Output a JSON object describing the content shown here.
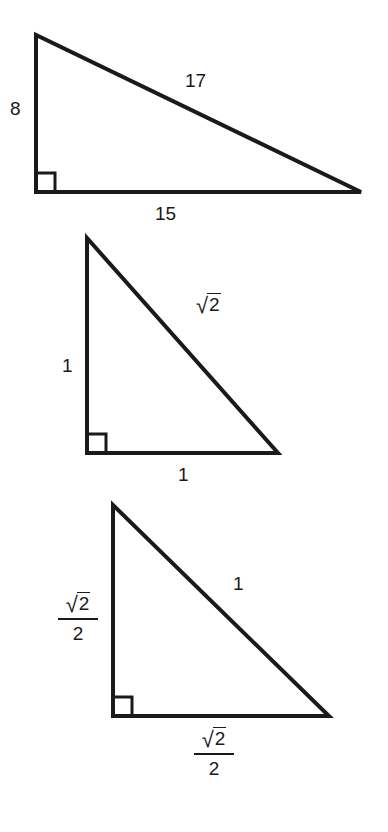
{
  "document": {
    "title": "Three right triangles with labeled sides",
    "background_color": "#ffffff",
    "stroke_color": "#1a1a1a",
    "text_color": "#1a1a1a"
  },
  "figures": [
    {
      "id": "triangle-8-15-17",
      "description": "Right triangle with legs 8 and 15 and hypotenuse 17",
      "vertices": {
        "apex": [
          36,
          35
        ],
        "right_angle": [
          36,
          192
        ],
        "base_right": [
          361,
          192
        ]
      },
      "labels": {
        "vertical_leg": "8",
        "horizontal_leg": "15",
        "hypotenuse": "17"
      }
    },
    {
      "id": "triangle-1-1-sqrt2",
      "description": "Right triangle with legs 1 and 1 and hypotenuse square root of 2",
      "vertices": {
        "apex": [
          87,
          238
        ],
        "right_angle": [
          87,
          453
        ],
        "base_right": [
          278,
          453
        ]
      },
      "labels": {
        "vertical_leg": "1",
        "horizontal_leg": "1",
        "hypotenuse_radicand": "2",
        "hypotenuse_radical_sign": "√"
      }
    },
    {
      "id": "triangle-half-sqrt2",
      "description": "Right triangle with legs square root of 2 over 2 and hypotenuse 1",
      "vertices": {
        "apex": [
          113,
          505
        ],
        "right_angle": [
          113,
          716
        ],
        "base_right": [
          329,
          716
        ]
      },
      "labels": {
        "vertical_leg_numerator_radicand": "2",
        "vertical_leg_numerator_radical_sign": "√",
        "vertical_leg_denominator": "2",
        "horizontal_leg_numerator_radicand": "2",
        "horizontal_leg_numerator_radical_sign": "√",
        "horizontal_leg_denominator": "2",
        "hypotenuse": "1"
      }
    }
  ]
}
